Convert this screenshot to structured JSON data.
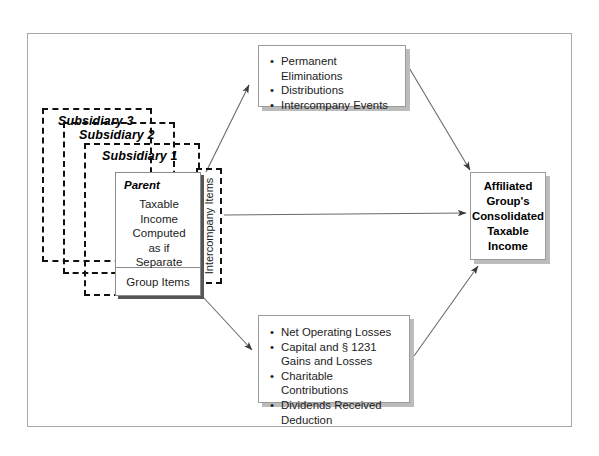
{
  "diagram": {
    "subsidiaries": [
      {
        "label": "Subsidiary 3"
      },
      {
        "label": "Subsidiary 2"
      },
      {
        "label": "Subsidiary 1"
      }
    ],
    "parent": {
      "title": "Parent",
      "body_lines": "Taxable\nIncome\nComputed\nas if\nSeparate",
      "group_items_label": "Group Items"
    },
    "intercompany": {
      "label": "Intercompany Items"
    },
    "top_box": {
      "items": [
        {
          "text": "Permanent Eliminations",
          "cont": ""
        },
        {
          "text": "Distributions",
          "cont": ""
        },
        {
          "text": "Intercompany Events",
          "cont": ""
        }
      ]
    },
    "bottom_box": {
      "items": [
        {
          "text": "Net Operating Losses",
          "cont": ""
        },
        {
          "text": "Capital and § 1231",
          "cont": "Gains and Losses"
        },
        {
          "text": "Charitable Contributions",
          "cont": ""
        },
        {
          "text": "Dividends Received",
          "cont": "Deduction"
        }
      ]
    },
    "result_box": {
      "line1": "Affiliated",
      "line2": "Group's",
      "line3": "Consolidated",
      "line4": "Taxable",
      "line5": "Income"
    },
    "colors": {
      "frame_border": "#a8a8a8",
      "dashed_border": "#111111",
      "card_border": "#9a9a9a",
      "card_shadow": "#bcbcbc",
      "parent_shadow": "#565656",
      "arrow": "#4a4a4a",
      "text": "#1c1c1c",
      "background": "#ffffff"
    }
  }
}
